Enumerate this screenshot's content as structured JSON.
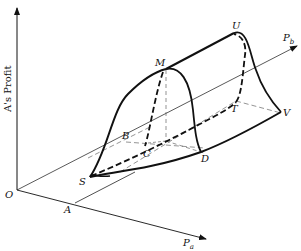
{
  "figure": {
    "axes": {
      "vertical_label": "A's Profit",
      "pa_label": "P",
      "pa_sub": "a",
      "pb_label": "P",
      "pb_sub": "b",
      "origin_label": "O"
    },
    "points": {
      "A": "A",
      "B": "B",
      "C": "C",
      "D": "D",
      "M": "M",
      "S": "S",
      "T": "T",
      "U": "U",
      "V": "V"
    },
    "colors": {
      "ink": "#111111",
      "guide": "#555555",
      "background": "#ffffff"
    }
  }
}
